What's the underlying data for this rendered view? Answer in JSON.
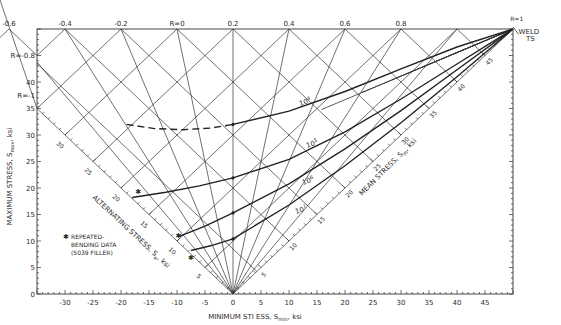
{
  "chart_data": {
    "type": "line",
    "xlabel": "MINIMUM STRESS, Smin, ksi",
    "ylabel": "MAXIMUM STRESS, Smax, ksi",
    "alt_axis_label": "ALTERNATING STRESS, Sa, ksi",
    "mean_axis_label": "MEAN STRESS, Sm, ksi",
    "xlim": [
      -35,
      50
    ],
    "ylim": [
      0,
      50
    ],
    "x_ticks": [
      -30,
      -25,
      -20,
      -15,
      -10,
      -5,
      0,
      5,
      10,
      15,
      20,
      25,
      30,
      35,
      40,
      45
    ],
    "y_ticks": [
      0,
      5,
      10,
      15,
      20,
      25,
      30,
      35,
      40
    ],
    "alt_ticks": [
      5,
      10,
      15,
      20,
      25,
      30
    ],
    "mean_ticks": [
      5,
      10,
      15,
      20,
      25,
      30,
      35,
      40,
      45
    ],
    "r_ratios_top": [
      "-0.6",
      "-0.4",
      "-0.2",
      "R=0",
      "0.2",
      "0.4",
      "0.6",
      "0.8"
    ],
    "r_ratios_left": [
      "R=-0.8",
      "R=-1"
    ],
    "r_one_label": "R=1",
    "apex_label": [
      "WELD",
      "TS"
    ],
    "series": [
      {
        "name": "10^4",
        "label": "10",
        "exp": "4",
        "dashed_until": 0,
        "points": [
          [
            -19,
            32
          ],
          [
            -14,
            31.2
          ],
          [
            -9,
            31
          ],
          [
            -4,
            31.3
          ],
          [
            0,
            32
          ],
          [
            10,
            34.5
          ],
          [
            20,
            38.2
          ],
          [
            30,
            42.5
          ],
          [
            40,
            46.6
          ],
          [
            50,
            50
          ]
        ]
      },
      {
        "name": "10^5",
        "label": "10",
        "exp": "5",
        "points": [
          [
            -18,
            18.2
          ],
          [
            -12,
            19.2
          ],
          [
            -6,
            20.4
          ],
          [
            0,
            21.9
          ],
          [
            10,
            25.4
          ],
          [
            20,
            30.6
          ],
          [
            30,
            36.8
          ],
          [
            40,
            43.4
          ],
          [
            50,
            50
          ]
        ]
      },
      {
        "name": "10^6",
        "label": "10",
        "exp": "6",
        "points": [
          [
            -9.8,
            10.8
          ],
          [
            -5,
            12.8
          ],
          [
            0,
            15.3
          ],
          [
            10,
            20.8
          ],
          [
            20,
            27.4
          ],
          [
            30,
            34.6
          ],
          [
            40,
            42.3
          ],
          [
            50,
            50
          ]
        ]
      },
      {
        "name": "10^7",
        "label": "10",
        "exp": "7",
        "points": [
          [
            -7.5,
            8.2
          ],
          [
            -4,
            9.1
          ],
          [
            0,
            10.4
          ],
          [
            10,
            16.8
          ],
          [
            20,
            24.2
          ],
          [
            30,
            32.3
          ],
          [
            40,
            41
          ],
          [
            50,
            50
          ]
        ]
      }
    ],
    "repeated_bending_points": [
      [
        -17,
        19.4
      ],
      [
        -9.8,
        11.1
      ],
      [
        -7.6,
        6.9
      ]
    ],
    "legend": {
      "marker": "*",
      "text": [
        "REPEATED-",
        "BENDING DATA",
        "(5039 FILLER)"
      ]
    },
    "grid": false,
    "legend_position": "lower-left"
  }
}
